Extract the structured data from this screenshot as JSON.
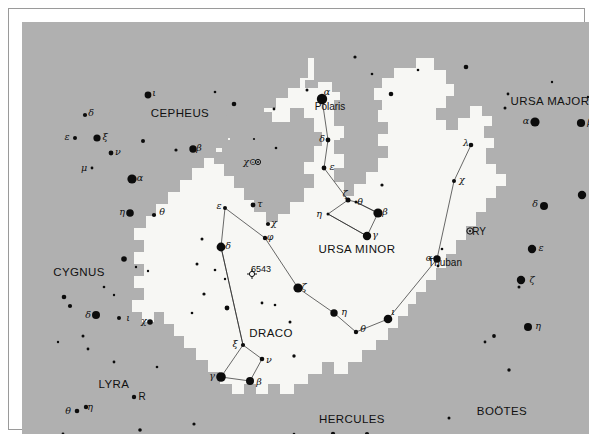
{
  "chart_data": {
    "type": "scatter",
    "background_color": "#b0b0b0",
    "highlight_color": "#f7f7f4",
    "star_color": "#0c0c0c",
    "constellation_labels": [
      {
        "text": "CEPHEUS",
        "x": 158,
        "y": 92
      },
      {
        "text": "URSA MAJOR",
        "x": 528,
        "y": 80
      },
      {
        "text": "URSA MINOR",
        "x": 335,
        "y": 228
      },
      {
        "text": "CYGNUS",
        "x": 57,
        "y": 251
      },
      {
        "text": "DRACO",
        "x": 249,
        "y": 312
      },
      {
        "text": "LYRA",
        "x": 92,
        "y": 363
      },
      {
        "text": "HERCULES",
        "x": 330,
        "y": 398
      },
      {
        "text": "BOÖTES",
        "x": 480,
        "y": 390
      }
    ],
    "proper_names": [
      {
        "text": "Polaris",
        "x": 308,
        "y": 85
      },
      {
        "text": "Thuban",
        "x": 423,
        "y": 241
      },
      {
        "text": "RY",
        "x": 457,
        "y": 210
      },
      {
        "text": "R",
        "x": 120,
        "y": 375
      },
      {
        "text": "6543",
        "x": 239,
        "y": 247
      }
    ],
    "greek_labels": [
      {
        "t": "ι",
        "x": 132,
        "y": 71
      },
      {
        "t": "δ",
        "x": 69,
        "y": 91
      },
      {
        "t": "ξ",
        "x": 83,
        "y": 115
      },
      {
        "t": "ε",
        "x": 45,
        "y": 115
      },
      {
        "t": "ν",
        "x": 96,
        "y": 130
      },
      {
        "t": "μ",
        "x": 62,
        "y": 146
      },
      {
        "t": "β",
        "x": 177,
        "y": 126
      },
      {
        "t": "α",
        "x": 118,
        "y": 156
      },
      {
        "t": "η",
        "x": 100,
        "y": 190
      },
      {
        "t": "θ",
        "x": 140,
        "y": 190
      },
      {
        "t": "χ⊙",
        "x": 228,
        "y": 140
      },
      {
        "t": "ε",
        "x": 197,
        "y": 184
      },
      {
        "t": "τ",
        "x": 238,
        "y": 182
      },
      {
        "t": "χ",
        "x": 252,
        "y": 201
      },
      {
        "t": "δ",
        "x": 206,
        "y": 224
      },
      {
        "t": "φ",
        "x": 248,
        "y": 215
      },
      {
        "t": "α",
        "x": 305,
        "y": 70
      },
      {
        "t": "δ",
        "x": 300,
        "y": 117
      },
      {
        "t": "ε",
        "x": 310,
        "y": 145
      },
      {
        "t": "ζ",
        "x": 323,
        "y": 172
      },
      {
        "t": "θ",
        "x": 338,
        "y": 180
      },
      {
        "t": "η",
        "x": 297,
        "y": 192
      },
      {
        "t": "β",
        "x": 363,
        "y": 190
      },
      {
        "t": "γ",
        "x": 353,
        "y": 213
      },
      {
        "t": "λ",
        "x": 444,
        "y": 121
      },
      {
        "t": "χ",
        "x": 440,
        "y": 158
      },
      {
        "t": "α",
        "x": 407,
        "y": 236
      },
      {
        "t": "ζ",
        "x": 282,
        "y": 265
      },
      {
        "t": "η",
        "x": 322,
        "y": 290
      },
      {
        "t": "θ",
        "x": 341,
        "y": 307
      },
      {
        "t": "ι",
        "x": 371,
        "y": 290
      },
      {
        "t": "ξ",
        "x": 213,
        "y": 322
      },
      {
        "t": "ν",
        "x": 247,
        "y": 338
      },
      {
        "t": "γ",
        "x": 190,
        "y": 354
      },
      {
        "t": "β",
        "x": 237,
        "y": 360
      },
      {
        "t": "α",
        "x": 504,
        "y": 99
      },
      {
        "t": "β",
        "x": 568,
        "y": 100
      },
      {
        "t": "γ",
        "x": 570,
        "y": 172
      },
      {
        "t": "δ",
        "x": 513,
        "y": 182
      },
      {
        "t": "ε",
        "x": 519,
        "y": 226
      },
      {
        "t": "ζ",
        "x": 510,
        "y": 258
      },
      {
        "t": "η",
        "x": 516,
        "y": 304
      },
      {
        "t": "δ",
        "x": 66,
        "y": 293
      },
      {
        "t": "ι",
        "x": 106,
        "y": 296
      },
      {
        "t": "χ",
        "x": 122,
        "y": 299
      },
      {
        "t": "θ",
        "x": 46,
        "y": 389
      },
      {
        "t": "η",
        "x": 68,
        "y": 385
      }
    ],
    "stars": [
      {
        "x": 126,
        "y": 73,
        "r": 3.4
      },
      {
        "x": 63,
        "y": 93,
        "r": 2.1
      },
      {
        "x": 75,
        "y": 116,
        "r": 3.6
      },
      {
        "x": 53,
        "y": 116,
        "r": 2.0
      },
      {
        "x": 89,
        "y": 131,
        "r": 2.4
      },
      {
        "x": 70,
        "y": 146,
        "r": 1.4
      },
      {
        "x": 171,
        "y": 127,
        "r": 3.7
      },
      {
        "x": 110,
        "y": 157,
        "r": 4.6
      },
      {
        "x": 108,
        "y": 191,
        "r": 3.8
      },
      {
        "x": 132,
        "y": 193,
        "r": 2.1
      },
      {
        "x": 193,
        "y": 70,
        "r": 1.3
      },
      {
        "x": 212,
        "y": 82,
        "r": 2.3
      },
      {
        "x": 121,
        "y": 119,
        "r": 2.0
      },
      {
        "x": 154,
        "y": 128,
        "r": 1.6
      },
      {
        "x": 252,
        "y": 87,
        "r": 1.4
      },
      {
        "x": 285,
        "y": 68,
        "r": 1.5
      },
      {
        "x": 300,
        "y": 77,
        "r": 5.2
      },
      {
        "x": 306,
        "y": 118,
        "r": 2.4
      },
      {
        "x": 302,
        "y": 146,
        "r": 2.4
      },
      {
        "x": 326,
        "y": 178,
        "r": 2.5
      },
      {
        "x": 334,
        "y": 180,
        "r": 1.5
      },
      {
        "x": 306,
        "y": 192,
        "r": 1.5
      },
      {
        "x": 356,
        "y": 191,
        "r": 4.6
      },
      {
        "x": 345,
        "y": 214,
        "r": 4.2
      },
      {
        "x": 360,
        "y": 163,
        "r": 1.6
      },
      {
        "x": 369,
        "y": 72,
        "r": 2.3
      },
      {
        "x": 333,
        "y": 35,
        "r": 1.6
      },
      {
        "x": 254,
        "y": 126,
        "r": 1.3
      },
      {
        "x": 232,
        "y": 117,
        "r": 1.1
      },
      {
        "x": 203,
        "y": 186,
        "r": 2.0
      },
      {
        "x": 231,
        "y": 183,
        "r": 2.4
      },
      {
        "x": 246,
        "y": 202,
        "r": 2.1
      },
      {
        "x": 199,
        "y": 225,
        "r": 4.4
      },
      {
        "x": 243,
        "y": 216,
        "r": 2.2
      },
      {
        "x": 180,
        "y": 217,
        "r": 1.5
      },
      {
        "x": 175,
        "y": 242,
        "r": 1.5
      },
      {
        "x": 193,
        "y": 248,
        "r": 1.3
      },
      {
        "x": 203,
        "y": 257,
        "r": 1.2
      },
      {
        "x": 276,
        "y": 266,
        "r": 4.6
      },
      {
        "x": 312,
        "y": 291,
        "r": 3.7
      },
      {
        "x": 334,
        "y": 310,
        "r": 2.2
      },
      {
        "x": 366,
        "y": 297,
        "r": 4.3
      },
      {
        "x": 221,
        "y": 323,
        "r": 2.1
      },
      {
        "x": 240,
        "y": 337,
        "r": 2.3
      },
      {
        "x": 199,
        "y": 355,
        "r": 4.8
      },
      {
        "x": 228,
        "y": 359,
        "r": 4.0
      },
      {
        "x": 449,
        "y": 123,
        "r": 2.3
      },
      {
        "x": 432,
        "y": 159,
        "r": 2.0
      },
      {
        "x": 415,
        "y": 237,
        "r": 3.7
      },
      {
        "x": 416,
        "y": 244,
        "r": 1.4
      },
      {
        "x": 420,
        "y": 227,
        "r": 1.3
      },
      {
        "x": 268,
        "y": 300,
        "r": 1.5
      },
      {
        "x": 205,
        "y": 286,
        "r": 2.4
      },
      {
        "x": 182,
        "y": 272,
        "r": 1.6
      },
      {
        "x": 170,
        "y": 291,
        "r": 1.3
      },
      {
        "x": 240,
        "y": 281,
        "r": 1.4
      },
      {
        "x": 513,
        "y": 100,
        "r": 4.6
      },
      {
        "x": 559,
        "y": 101,
        "r": 4.1
      },
      {
        "x": 560,
        "y": 173,
        "r": 4.2
      },
      {
        "x": 522,
        "y": 184,
        "r": 4.0
      },
      {
        "x": 510,
        "y": 227,
        "r": 4.2
      },
      {
        "x": 499,
        "y": 258,
        "r": 4.2
      },
      {
        "x": 497,
        "y": 265,
        "r": 1.5
      },
      {
        "x": 506,
        "y": 305,
        "r": 4.0
      },
      {
        "x": 472,
        "y": 314,
        "r": 1.9
      },
      {
        "x": 463,
        "y": 320,
        "r": 1.4
      },
      {
        "x": 487,
        "y": 348,
        "r": 1.7
      },
      {
        "x": 500,
        "y": 420,
        "r": 4.6
      },
      {
        "x": 486,
        "y": 72,
        "r": 1.4
      },
      {
        "x": 483,
        "y": 86,
        "r": 1.5
      },
      {
        "x": 566,
        "y": 75,
        "r": 1.2
      },
      {
        "x": 530,
        "y": 60,
        "r": 1.2
      },
      {
        "x": 444,
        "y": 45,
        "r": 2.3
      },
      {
        "x": 396,
        "y": 48,
        "r": 1.3
      },
      {
        "x": 350,
        "y": 52,
        "r": 1.3
      },
      {
        "x": 74,
        "y": 293,
        "r": 4.0
      },
      {
        "x": 97,
        "y": 296,
        "r": 2.0
      },
      {
        "x": 128,
        "y": 300,
        "r": 2.8
      },
      {
        "x": 42,
        "y": 275,
        "r": 2.3
      },
      {
        "x": 48,
        "y": 284,
        "r": 2.1
      },
      {
        "x": 102,
        "y": 237,
        "r": 2.8
      },
      {
        "x": 55,
        "y": 389,
        "r": 2.3
      },
      {
        "x": 64,
        "y": 385,
        "r": 2.2
      },
      {
        "x": 112,
        "y": 375,
        "r": 2.2
      },
      {
        "x": 61,
        "y": 314,
        "r": 1.5
      },
      {
        "x": 66,
        "y": 327,
        "r": 1.4
      },
      {
        "x": 82,
        "y": 265,
        "r": 1.3
      },
      {
        "x": 92,
        "y": 273,
        "r": 1.2
      },
      {
        "x": 36,
        "y": 320,
        "r": 1.2
      },
      {
        "x": 114,
        "y": 245,
        "r": 1.2
      },
      {
        "x": 126,
        "y": 249,
        "r": 1.2
      },
      {
        "x": 118,
        "y": 408,
        "r": 1.8
      },
      {
        "x": 172,
        "y": 402,
        "r": 1.6
      },
      {
        "x": 272,
        "y": 412,
        "r": 1.3
      },
      {
        "x": 311,
        "y": 412,
        "r": 2.2
      },
      {
        "x": 345,
        "y": 412,
        "r": 2.1
      },
      {
        "x": 427,
        "y": 396,
        "r": 1.5
      },
      {
        "x": 41,
        "y": 412,
        "r": 1.4
      },
      {
        "x": 92,
        "y": 340,
        "r": 1.4
      },
      {
        "x": 135,
        "y": 345,
        "r": 1.3
      },
      {
        "x": 253,
        "y": 283,
        "r": 1.3
      },
      {
        "x": 272,
        "y": 334,
        "r": 1.7
      }
    ]
  }
}
